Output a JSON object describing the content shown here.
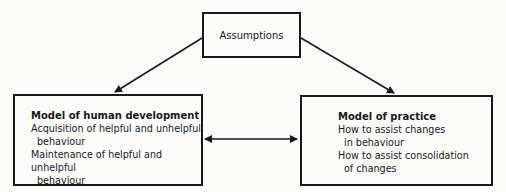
{
  "top_box": {
    "label": "Assumptions"
  },
  "left_box": {
    "title": "Model of human development",
    "lines": [
      "Acquisition of helpful and unhelpful",
      "behaviour",
      "Maintenance of helpful and unhelpful",
      "behaviour"
    ]
  },
  "right_box": {
    "title": "Model of practice",
    "lines": [
      "How to assist changes",
      "in behaviour",
      "How to assist consolidation",
      "of changes"
    ]
  },
  "arrows": [
    {
      "from": "Assumptions",
      "to": "Model of human development"
    },
    {
      "from": "Assumptions",
      "to": "Model of practice"
    },
    {
      "between": [
        "Model of human development",
        "Model of practice"
      ],
      "type": "bidirectional"
    }
  ]
}
